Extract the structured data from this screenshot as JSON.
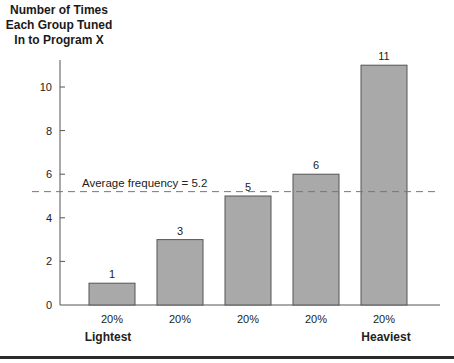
{
  "chart_data": {
    "type": "bar",
    "title": "",
    "ylabel": "Number of Times Each Group Tuned In to Program X",
    "ylabel_lines": [
      "Number of Times",
      "Each Group Tuned",
      "In to Program X"
    ],
    "xlabel": "",
    "categories": [
      "20%",
      "20%",
      "20%",
      "20%",
      "20%"
    ],
    "values": [
      1,
      3,
      5,
      6,
      11
    ],
    "value_labels": [
      "1",
      "3",
      "5",
      "6",
      "11"
    ],
    "category_end_labels": {
      "first": "Lightest",
      "last": "Heaviest"
    },
    "ylim": [
      0,
      11
    ],
    "yticks": [
      0,
      2,
      4,
      6,
      8,
      10
    ],
    "grid": false,
    "legend": null,
    "reference_line": {
      "value": 5.2,
      "style": "dashed",
      "label": "Average frequency = 5.2"
    },
    "colors": {
      "bar_fill": "#a9a9a9",
      "bar_stroke": "#555555",
      "axis": "#555555",
      "avg_line": "#777777"
    }
  }
}
